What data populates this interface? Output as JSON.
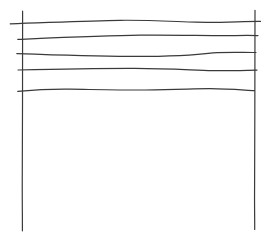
{
  "canvas": {
    "width": 267,
    "height": 237,
    "background_color": "#ffffff",
    "stroke_color": "#3a3a3a",
    "stroke_width": 1.2
  },
  "sketch": {
    "description": "freehand sketch of two tall vertical posts with five wavy horizontal wires strung between them near the top (fence / staff)",
    "strokes": [
      {
        "name": "left-post",
        "path": "M22.6,11.2 C22.2,50 22.8,120 22.3,170 C22.1,195 22.5,220 22.4,230.8"
      },
      {
        "name": "right-post",
        "path": "M255.0,10.3 C254.6,60 255.1,130 254.6,185 C254.4,205 254.8,222 254.7,229.5"
      },
      {
        "name": "wire-1",
        "path": "M10.2,23.8 C50,22.5 90,20.6 120,20.3 C150,20.0 175,21.6 196,22.2 C220,22.8 245,21.2 260.5,21.4"
      },
      {
        "name": "wire-2",
        "path": "M17.8,39.4 C60,37.6 105,35.6 140,35.2 C175,34.9 205,35.7 228,35.6 C240,35.5 250,35.3 258.0,35.6"
      },
      {
        "name": "wire-3",
        "path": "M16.8,53.6 C45,54.6 90,56.2 130,56.4 C165,56.5 190,55.8 213,52.8 C228,52.1 245,52.6 256.0,52.5"
      },
      {
        "name": "wire-4",
        "path": "M18.0,70.0 C60,69.0 100,68.3 135,68.4 C170,68.6 195,70.3 212,70.6 C230,70.9 248,70.2 257.0,70.1"
      },
      {
        "name": "wire-5",
        "path": "M17.8,91.4 C35,89.8 55,89.0 70,89.2 C105,89.7 125,90.1 145,90.0 C180,89.7 195,88.6 210,88.7 C230,88.9 245,90.2 254.5,90.6"
      }
    ]
  }
}
